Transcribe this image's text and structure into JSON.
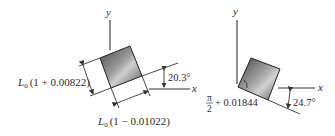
{
  "figure": {
    "left": {
      "axis_x_label": "x",
      "axis_y_label": "y",
      "rotation_angle": "20.3°",
      "side_label_1_prefix": "L",
      "side_label_1_subscript": "0",
      "side_label_1_expr": "(1 + 0.00822)",
      "side_label_2_prefix": "L",
      "side_label_2_subscript": "0",
      "side_label_2_expr": "(1 − 0.01022)"
    },
    "right": {
      "axis_x_label": "x",
      "axis_y_label": "y",
      "rotation_angle": "24.7°",
      "angle_numerator": "π",
      "angle_denominator": "2",
      "angle_suffix": "+ 0.01844"
    },
    "colors": {
      "element_dark": "#3a3a3a",
      "element_light": "#d8d8d8",
      "line": "#333333"
    }
  }
}
